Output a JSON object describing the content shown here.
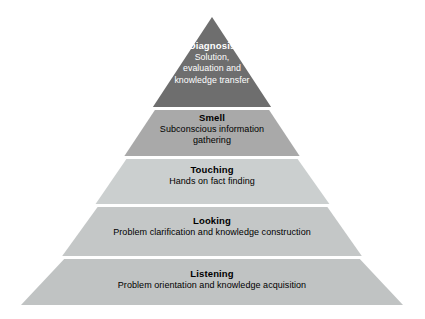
{
  "diagram": {
    "type": "pyramid",
    "background_color": "#ffffff",
    "apex": {
      "x": 212,
      "y": 17
    },
    "base": {
      "left_x": 22,
      "right_x": 403,
      "y": 305
    },
    "tiers": [
      {
        "level": 1,
        "name": "diagnosis",
        "title": "Diagnosis",
        "description": "Solution, evaluation and knowledge transfer",
        "description_lines": [
          "Solution,",
          "evaluation and",
          "knowledge transfer"
        ],
        "fill_color": "#6e6e6e",
        "text_color": "#ffffff",
        "top_y": 17,
        "bottom_y": 107
      },
      {
        "level": 2,
        "name": "smell",
        "title": "Smell",
        "description": "Subconscious information gathering",
        "description_lines": [
          "Subconscious information",
          "gathering"
        ],
        "fill_color": "#a9a9a9",
        "text_color": "#000000",
        "top_y": 110,
        "bottom_y": 156
      },
      {
        "level": 3,
        "name": "touching",
        "title": "Touching",
        "description": "Hands on fact finding",
        "description_lines": [
          "Hands on fact finding"
        ],
        "fill_color": "#cbcfcf",
        "text_color": "#000000",
        "top_y": 159,
        "bottom_y": 204
      },
      {
        "level": 4,
        "name": "looking",
        "title": "Looking",
        "description": "Problem clarification and knowledge construction",
        "description_lines": [
          "Problem clarification and knowledge construction"
        ],
        "fill_color": "#c4c7c7",
        "text_color": "#000000",
        "top_y": 207,
        "bottom_y": 256
      },
      {
        "level": 5,
        "name": "listening",
        "title": "Listening",
        "description": "Problem orientation and knowledge acquisition",
        "description_lines": [
          "Problem orientation and knowledge acquisition"
        ],
        "fill_color": "#c0c3c3",
        "text_color": "#000000",
        "top_y": 259,
        "bottom_y": 305
      }
    ]
  }
}
